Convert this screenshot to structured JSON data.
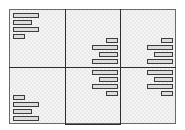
{
  "diagram": {
    "type": "grid-layout-wireframe",
    "rows": 2,
    "columns": 3,
    "colors": {
      "border": "#3c3c3c",
      "divider": "#2e2e2e",
      "fill": "#e9e9e9",
      "bar_fill": "#dcdcdc"
    },
    "cells": [
      {
        "id": "top-left",
        "align": "left",
        "valign": "top",
        "bars": [
          {
            "x": 13,
            "y": 13,
            "w": 24
          },
          {
            "x": 13,
            "y": 20,
            "w": 17
          },
          {
            "x": 13,
            "y": 27,
            "w": 24
          },
          {
            "x": 13,
            "y": 34,
            "w": 10
          }
        ]
      },
      {
        "id": "top-middle",
        "align": "right",
        "valign": "bottom",
        "bars": [
          {
            "x": 106,
            "y": 38,
            "w": 10
          },
          {
            "x": 92,
            "y": 45,
            "w": 24
          },
          {
            "x": 99,
            "y": 52,
            "w": 17
          },
          {
            "x": 92,
            "y": 59,
            "w": 24
          }
        ]
      },
      {
        "id": "top-right",
        "align": "right",
        "valign": "bottom",
        "bars": [
          {
            "x": 161,
            "y": 38,
            "w": 10
          },
          {
            "x": 147,
            "y": 45,
            "w": 24
          },
          {
            "x": 154,
            "y": 52,
            "w": 17
          },
          {
            "x": 147,
            "y": 59,
            "w": 24
          }
        ]
      },
      {
        "id": "bottom-left",
        "align": "left",
        "valign": "bottom",
        "bars": [
          {
            "x": 13,
            "y": 95,
            "w": 10
          },
          {
            "x": 13,
            "y": 102,
            "w": 24
          },
          {
            "x": 13,
            "y": 109,
            "w": 17
          },
          {
            "x": 13,
            "y": 116,
            "w": 24
          }
        ]
      },
      {
        "id": "bottom-middle",
        "align": "right",
        "valign": "top",
        "bars": [
          {
            "x": 92,
            "y": 70,
            "w": 24
          },
          {
            "x": 99,
            "y": 77,
            "w": 17
          },
          {
            "x": 92,
            "y": 84,
            "w": 24
          },
          {
            "x": 106,
            "y": 91,
            "w": 10
          }
        ]
      },
      {
        "id": "bottom-right",
        "align": "right",
        "valign": "top",
        "bars": [
          {
            "x": 147,
            "y": 70,
            "w": 24
          },
          {
            "x": 154,
            "y": 77,
            "w": 17
          },
          {
            "x": 147,
            "y": 84,
            "w": 24
          },
          {
            "x": 161,
            "y": 91,
            "w": 10
          }
        ]
      }
    ]
  }
}
